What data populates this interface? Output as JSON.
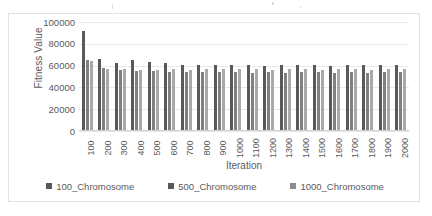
{
  "chart_data": {
    "type": "bar",
    "title": "",
    "xlabel": "Iteration",
    "ylabel": "Fitness Value",
    "ylim": [
      0,
      100000
    ],
    "yticks": [
      100000,
      80000,
      60000,
      40000,
      20000,
      0
    ],
    "grid": true,
    "legend_position": "bottom",
    "categories": [
      "100",
      "200",
      "300",
      "400",
      "500",
      "600",
      "700",
      "800",
      "900",
      "1000",
      "1100",
      "1200",
      "1300",
      "1400",
      "1500",
      "1600",
      "1700",
      "1800",
      "1900",
      "2000"
    ],
    "series": [
      {
        "name": "100_Chromosome",
        "color": "#595959",
        "values": [
          92000,
          66000,
          62000,
          65000,
          63000,
          62000,
          61000,
          61000,
          61000,
          61000,
          61000,
          60000,
          61000,
          61000,
          61000,
          60000,
          61000,
          61000,
          61000,
          61000
        ]
      },
      {
        "name": "500_Chromosome",
        "color": "#808080",
        "values": [
          65000,
          58000,
          56000,
          55000,
          55000,
          54000,
          54000,
          54000,
          54000,
          54000,
          53000,
          54000,
          53000,
          54000,
          54000,
          53000,
          54000,
          53000,
          54000,
          54000
        ]
      },
      {
        "name": "1000_Chromosome",
        "color": "#a9a9a9",
        "values": [
          64000,
          57000,
          57000,
          56000,
          56000,
          57000,
          56000,
          57000,
          57000,
          57000,
          57000,
          56000,
          57000,
          57000,
          56000,
          57000,
          57000,
          56000,
          57000,
          57000
        ]
      }
    ]
  },
  "legend": {
    "items": [
      {
        "label": "100_Chromosome"
      },
      {
        "label": "500_Chromosome"
      },
      {
        "label": "1000_Chromosome"
      }
    ]
  }
}
